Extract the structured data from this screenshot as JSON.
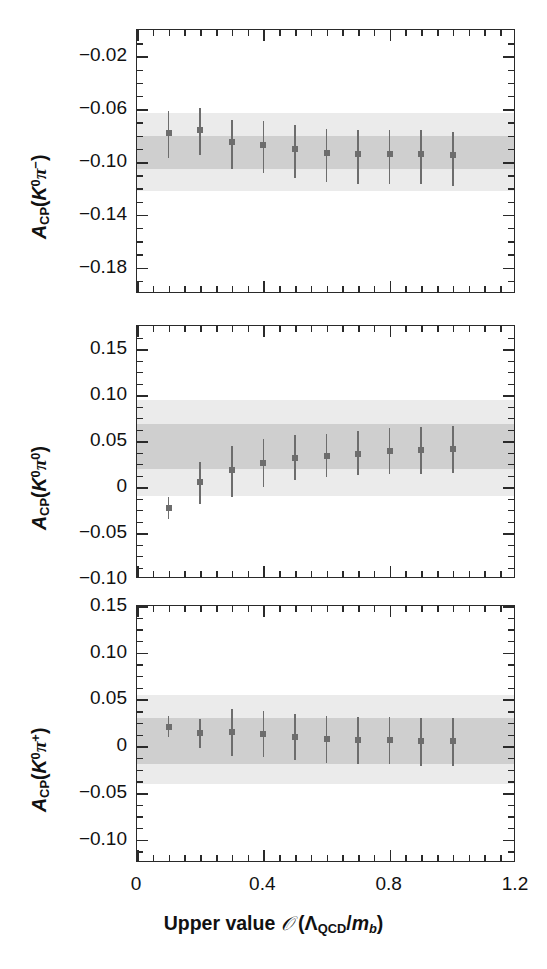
{
  "figure": {
    "x_axis_title": "Upper value 𝒪 (Λ_QCD/m_b)",
    "x_axis_title_parts": {
      "lead": "Upper value",
      "script_o": "𝒪",
      "open": "(",
      "lambda": "Λ",
      "lambda_sub": "QCD",
      "slash": "/",
      "m": "m",
      "m_sub": "b",
      "close": ")"
    },
    "x_ticks": [
      "0",
      "0.4",
      "0.8",
      "1.2"
    ],
    "x_tick_values": [
      0,
      0.4,
      0.8,
      1.2
    ],
    "xlim": [
      0,
      1.2
    ]
  },
  "chart_data": [
    {
      "type": "scatter",
      "panel_index": 0,
      "title": "",
      "ylabel": "A_CP(K0 pi-)",
      "ylabel_parts": {
        "a": "A",
        "cp": "CP",
        "open": "(",
        "k": "K",
        "k_sup": "0",
        "pi": "π",
        "pi_sup": "−",
        "close": ")"
      },
      "xlabel": "",
      "xlim": [
        0,
        1.2
      ],
      "ylim": [
        -0.2,
        0.0
      ],
      "yticks": [
        -0.02,
        -0.06,
        -0.1,
        -0.14,
        -0.18
      ],
      "ytick_labels": [
        "−0.02",
        "−0.06",
        "−0.10",
        "−0.14",
        "−0.18"
      ],
      "minor_tick_step": 0.01,
      "grid": false,
      "legend": "none",
      "x": [
        0.1,
        0.2,
        0.3,
        0.4,
        0.5,
        0.6,
        0.7,
        0.8,
        0.9,
        1.0
      ],
      "values": [
        -0.078,
        -0.076,
        -0.085,
        -0.087,
        -0.09,
        -0.093,
        -0.094,
        -0.094,
        -0.094,
        -0.095
      ],
      "yerr_low": [
        0.019,
        0.019,
        0.02,
        0.021,
        0.022,
        0.022,
        0.023,
        0.023,
        0.023,
        0.023
      ],
      "yerr_high": [
        0.017,
        0.017,
        0.017,
        0.018,
        0.018,
        0.018,
        0.018,
        0.018,
        0.018,
        0.018
      ],
      "bands": [
        {
          "name": "outer-band",
          "low": -0.122,
          "high": -0.063,
          "color": "#ebebeb"
        },
        {
          "name": "inner-band",
          "low": -0.105,
          "high": -0.08,
          "color": "#cfcfcf"
        }
      ]
    },
    {
      "type": "scatter",
      "panel_index": 1,
      "title": "",
      "ylabel": "A_CP(K0 pi0)",
      "ylabel_parts": {
        "a": "A",
        "cp": "CP",
        "open": "(",
        "k": "K",
        "k_sup": "0",
        "pi": "π",
        "pi_sup": "0",
        "close": ")"
      },
      "xlabel": "",
      "xlim": [
        0,
        1.2
      ],
      "ylim": [
        -0.1,
        0.175
      ],
      "yticks": [
        0.15,
        0.1,
        0.05,
        0,
        -0.05,
        -0.1
      ],
      "ytick_labels": [
        "0.15",
        "0.10",
        "0.05",
        "0",
        "−0.05",
        "−0.10"
      ],
      "minor_tick_step": 0.0125,
      "grid": false,
      "legend": "none",
      "x": [
        0.1,
        0.2,
        0.3,
        0.4,
        0.5,
        0.6,
        0.7,
        0.8,
        0.9,
        1.0
      ],
      "values": [
        -0.023,
        0.005,
        0.018,
        0.026,
        0.031,
        0.034,
        0.036,
        0.039,
        0.04,
        0.041
      ],
      "yerr_low": [
        0.012,
        0.024,
        0.029,
        0.026,
        0.023,
        0.023,
        0.023,
        0.025,
        0.026,
        0.026
      ],
      "yerr_high": [
        0.012,
        0.022,
        0.027,
        0.026,
        0.025,
        0.024,
        0.025,
        0.025,
        0.025,
        0.025
      ],
      "bands": [
        {
          "name": "outer-band",
          "low": -0.01,
          "high": 0.095,
          "color": "#ebebeb"
        },
        {
          "name": "inner-band",
          "low": 0.02,
          "high": 0.068,
          "color": "#cfcfcf"
        }
      ]
    },
    {
      "type": "scatter",
      "panel_index": 2,
      "title": "",
      "ylabel": "A_CP(K0 pi+)",
      "ylabel_parts": {
        "a": "A",
        "cp": "CP",
        "open": "(",
        "k": "K",
        "k_sup": "0",
        "pi": "π",
        "pi_sup": "+",
        "close": ")"
      },
      "xlabel": "Upper value 𝒪 (Λ_QCD/m_b)",
      "xlim": [
        0,
        1.2
      ],
      "ylim": [
        -0.125,
        0.15
      ],
      "yticks": [
        0.15,
        0.1,
        0.05,
        0,
        -0.05,
        -0.1
      ],
      "ytick_labels": [
        "0.15",
        "0.10",
        "0.05",
        "0",
        "−0.05",
        "−0.10"
      ],
      "minor_tick_step": 0.0125,
      "grid": false,
      "legend": "none",
      "x": [
        0.1,
        0.2,
        0.3,
        0.4,
        0.5,
        0.6,
        0.7,
        0.8,
        0.9,
        1.0
      ],
      "values": [
        0.02,
        0.014,
        0.015,
        0.013,
        0.01,
        0.008,
        0.007,
        0.007,
        0.006,
        0.006
      ],
      "yerr_low": [
        0.01,
        0.016,
        0.025,
        0.025,
        0.025,
        0.026,
        0.026,
        0.026,
        0.027,
        0.027
      ],
      "yerr_high": [
        0.012,
        0.015,
        0.025,
        0.025,
        0.024,
        0.024,
        0.024,
        0.024,
        0.024,
        0.024
      ],
      "bands": [
        {
          "name": "outer-band",
          "low": -0.041,
          "high": 0.055,
          "color": "#ebebeb"
        },
        {
          "name": "inner-band",
          "low": -0.019,
          "high": 0.03,
          "color": "#cfcfcf"
        }
      ]
    }
  ],
  "colors": {
    "marker": "#6d6d6d",
    "errorbar": "#6d6d6d",
    "inner_band": "#cfcfcf",
    "outer_band": "#ebebeb",
    "axis": "#2a2a2a",
    "text": "#111111",
    "background": "#ffffff"
  }
}
